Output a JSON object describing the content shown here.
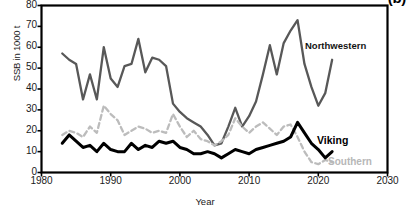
{
  "panel": {
    "label": "(b)"
  },
  "chart_data": {
    "type": "line",
    "title": "",
    "xlabel": "Year",
    "ylabel": "SSB in 1000 t",
    "xlim": [
      1980,
      2030
    ],
    "ylim": [
      0,
      80
    ],
    "xticks": [
      1980,
      1990,
      2000,
      2010,
      2020,
      2030
    ],
    "yticks": [
      0,
      10,
      20,
      30,
      40,
      50,
      60,
      70,
      80
    ],
    "grid": false,
    "legend_position": "inline-annotations",
    "x": [
      1983,
      1984,
      1985,
      1986,
      1987,
      1988,
      1989,
      1990,
      1991,
      1992,
      1993,
      1994,
      1995,
      1996,
      1997,
      1998,
      1999,
      2000,
      2001,
      2002,
      2003,
      2004,
      2005,
      2006,
      2007,
      2008,
      2009,
      2010,
      2011,
      2012,
      2013,
      2014,
      2015,
      2016,
      2017,
      2018,
      2019,
      2020,
      2021,
      2022
    ],
    "series": [
      {
        "name": "Northwestern",
        "color": "#585858",
        "style": "solid",
        "width": 2.3,
        "values": [
          57,
          54,
          52,
          35,
          47,
          35,
          60,
          45,
          41,
          51,
          52,
          64,
          48,
          55,
          54,
          51,
          33,
          29,
          26,
          24,
          22,
          18,
          13,
          14,
          22,
          31,
          22,
          27,
          34,
          47,
          61,
          47,
          62,
          68,
          73,
          52,
          41,
          32,
          38,
          54
        ]
      },
      {
        "name": "Southern",
        "color": "#bcbcbc",
        "style": "dashed",
        "width": 2.3,
        "values": [
          18,
          20,
          19,
          17,
          22,
          19,
          32,
          28,
          25,
          18,
          20,
          22,
          21,
          19,
          20,
          19,
          28,
          22,
          17,
          20,
          16,
          15,
          13,
          15,
          18,
          26,
          22,
          19,
          22,
          24,
          21,
          18,
          22,
          23,
          17,
          10,
          5,
          4,
          6,
          5
        ]
      },
      {
        "name": "Viking",
        "color": "#000000",
        "style": "solid",
        "width": 3.0,
        "values": [
          14,
          18,
          15,
          12,
          13,
          10,
          14,
          11,
          10,
          10,
          14,
          11,
          13,
          12,
          15,
          14,
          15,
          12,
          11,
          9,
          9,
          10,
          9,
          7,
          9,
          11,
          10,
          9,
          11,
          12,
          13,
          14,
          15,
          17,
          24,
          19,
          14,
          11,
          7,
          10
        ]
      }
    ],
    "annotations": [
      {
        "text": "Northwestern",
        "x": 2018,
        "y": 62
      },
      {
        "text": "Viking",
        "x": 2020,
        "y": 18
      },
      {
        "text": "Southern",
        "x": 2022,
        "y": 7
      }
    ]
  }
}
